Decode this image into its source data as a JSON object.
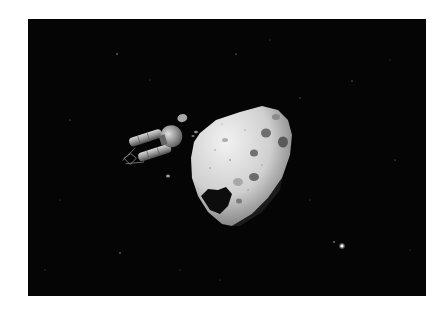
{
  "image": {
    "description": "Spacecraft approaching a cratered asteroid against a black starfield",
    "background_color": "#050505",
    "margin_color": "#ffffff",
    "frame": {
      "x": 28,
      "y": 19,
      "width": 398,
      "height": 277
    }
  },
  "subjects": [
    {
      "name": "spacecraft",
      "approx_bbox": [
        118,
        118,
        200,
        160
      ],
      "color": "#9a9a9a"
    },
    {
      "name": "asteroid",
      "approx_bbox": [
        190,
        105,
        292,
        228
      ],
      "color": "#cfcfcf"
    },
    {
      "name": "bright-star",
      "approx_pos": [
        342,
        246
      ]
    }
  ]
}
